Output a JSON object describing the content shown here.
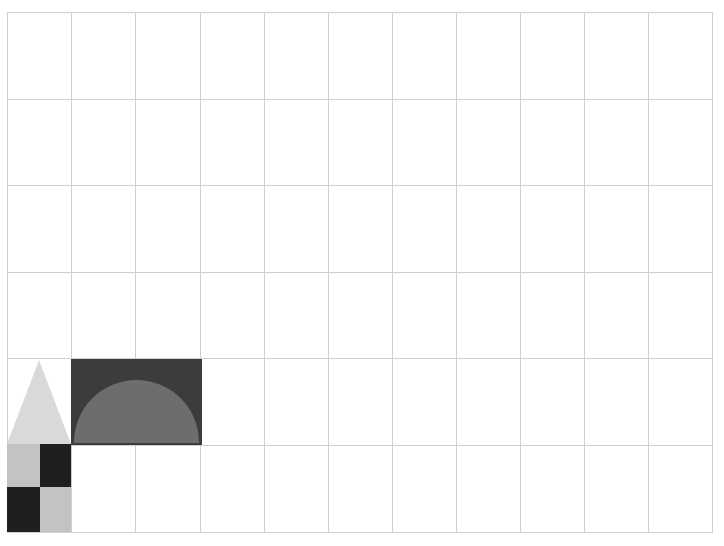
{
  "canvas": {
    "width": 724,
    "height": 546,
    "background": "#ffffff",
    "title": "shape composition on grid"
  },
  "grid": {
    "line_color": "#cfcfcf",
    "line_width": 1,
    "origin_x": 7,
    "origin_y": 12,
    "cell_width": 64.1,
    "cell_height": 86.7,
    "columns": 11,
    "rows": 6,
    "x_positions": [
      7,
      71,
      135,
      200,
      264,
      328,
      392,
      456,
      520,
      584,
      648,
      712
    ],
    "y_positions": [
      12,
      99,
      185,
      272,
      358,
      445,
      532
    ]
  },
  "shapes": [
    {
      "name": "triangle",
      "kind": "triangle",
      "color": "#d9d9d9",
      "x": 7,
      "y": 360,
      "width": 64,
      "height": 84,
      "grid_col": 0,
      "grid_row": 4
    },
    {
      "name": "dark-rectangle",
      "kind": "rectangle",
      "color": "#3c3c3c",
      "x": 71,
      "y": 359,
      "width": 131,
      "height": 86,
      "grid_col": 1,
      "grid_row": 4,
      "span_cols": 2,
      "span_rows": 1
    },
    {
      "name": "semicircle",
      "kind": "semicircle",
      "color": "#6d6d6d",
      "x": 74,
      "y": 380,
      "width": 125,
      "height": 63,
      "flat_edge": "bottom"
    },
    {
      "name": "checker-top-left",
      "kind": "rectangle",
      "color": "#c3c3c3",
      "x": 7,
      "y": 444,
      "width": 33,
      "height": 43
    },
    {
      "name": "checker-top-right",
      "kind": "rectangle",
      "color": "#1f1f1f",
      "x": 40,
      "y": 444,
      "width": 31,
      "height": 43
    },
    {
      "name": "checker-bottom-left",
      "kind": "rectangle",
      "color": "#1f1f1f",
      "x": 7,
      "y": 487,
      "width": 33,
      "height": 45
    },
    {
      "name": "checker-bottom-right",
      "kind": "rectangle",
      "color": "#c3c3c3",
      "x": 40,
      "y": 487,
      "width": 31,
      "height": 45
    }
  ]
}
